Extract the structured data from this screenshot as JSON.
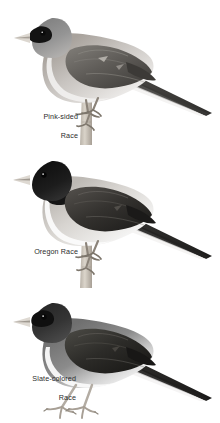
{
  "plate": {
    "background_color": "#ffffff",
    "ink_color": "#2b2b2b",
    "title": "",
    "subjects": [
      {
        "id": "pink-sided",
        "caption_lines": [
          "Pink-sided",
          "Race"
        ],
        "pose": "perched on vertical twig, facing left, tail to lower right",
        "hood_color": "#8f8f8f",
        "back_color": "#6b6b6b",
        "flank_color": "#bdbdbd",
        "belly_color": "#f2f2f2",
        "bill_color": "#dcd7d2",
        "eye_patch_color": "#1a1a1a",
        "leg_color": "#9a9289"
      },
      {
        "id": "oregon",
        "caption_lines": [
          "Oregon Race"
        ],
        "pose": "perched on vertical twig, facing left, tail to lower right",
        "hood_color": "#141414",
        "back_color": "#3a3a3a",
        "flank_color": "#c9c9c9",
        "belly_color": "#f4f4f4",
        "bill_color": "#ded9d3",
        "eye_patch_color": "#0d0d0d",
        "leg_color": "#9a9289"
      },
      {
        "id": "slate-colored",
        "caption_lines": [
          "Slate-colored",
          "Race"
        ],
        "pose": "standing on flat ground, facing left, tail to lower right",
        "hood_color": "#3d3d3d",
        "back_color": "#2e2e2e",
        "flank_color": "#8d8d8d",
        "belly_color": "#f4f4f4",
        "bill_color": "#ded9d3",
        "eye_patch_color": "#0d0d0d",
        "leg_color": "#b3aca3"
      }
    ]
  }
}
